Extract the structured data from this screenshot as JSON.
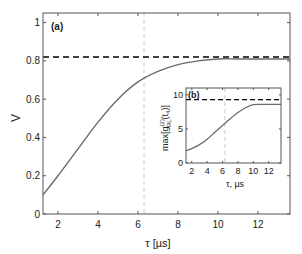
{
  "chart_data": [
    {
      "type": "line",
      "panel": "(a)",
      "title": "",
      "xlabel": "τ  [µs]",
      "ylabel": "V",
      "xlim": [
        1.25,
        13.6
      ],
      "ylim": [
        0,
        1.05
      ],
      "xticks": [
        2,
        4,
        6,
        8,
        10,
        12
      ],
      "yticks": [
        0,
        0.2,
        0.4,
        0.6,
        0.8,
        1
      ],
      "ytick_labels": [
        "0",
        "0.2",
        "0.4",
        "0.6",
        "0.8",
        "1"
      ],
      "grid": false,
      "series": [
        {
          "name": "V(τ)",
          "style": "solid",
          "color": "#6b6b6b",
          "x": [
            1.25,
            2,
            3,
            4,
            5,
            6,
            7,
            8,
            9,
            10,
            11,
            12,
            13.6
          ],
          "y": [
            0.1,
            0.2,
            0.34,
            0.48,
            0.6,
            0.69,
            0.745,
            0.78,
            0.8,
            0.81,
            0.81,
            0.81,
            0.81
          ]
        },
        {
          "name": "limit",
          "style": "dashed",
          "color": "#000000",
          "x": [
            1.25,
            13.6
          ],
          "y": [
            0.82,
            0.82
          ]
        }
      ],
      "vline": {
        "x": 6.3,
        "style": "dashed",
        "color": "#cccccc"
      }
    },
    {
      "type": "line",
      "panel": "(b)",
      "inset": true,
      "xlabel": "τ, µs",
      "ylabel": "max[g(2)RL(t4)]",
      "xlim": [
        1.25,
        13.6
      ],
      "ylim": [
        0,
        11
      ],
      "xticks": [
        2,
        4,
        6,
        8,
        10,
        12
      ],
      "yticks": [
        0,
        5,
        10
      ],
      "series": [
        {
          "name": "max g2",
          "style": "solid",
          "color": "#6b6b6b",
          "x": [
            1.25,
            2,
            3,
            4,
            5,
            6,
            7,
            8,
            9,
            10,
            11,
            12,
            13.6
          ],
          "y": [
            1.8,
            2.1,
            2.7,
            3.5,
            4.5,
            5.5,
            6.5,
            7.4,
            8.1,
            8.55,
            8.6,
            8.6,
            8.6
          ]
        },
        {
          "name": "limit",
          "style": "dashed",
          "color": "#000000",
          "x": [
            1.25,
            13.6
          ],
          "y": [
            9.3,
            9.3
          ]
        }
      ],
      "vline": {
        "x": 6.3,
        "style": "dashed",
        "color": "#cccccc"
      }
    }
  ],
  "labels": {
    "panel_a": "(a)",
    "panel_b": "(b)",
    "main_xlabel": "τ  [µs]",
    "main_ylabel": "V",
    "inset_xlabel": "τ, µs",
    "inset_ylabel_main": "max[g",
    "inset_ylabel_sup": "(2)",
    "inset_ylabel_sub": "RL",
    "inset_ylabel_tail": "(t",
    "inset_ylabel_sub2": "4",
    "inset_ylabel_end": ")]"
  }
}
